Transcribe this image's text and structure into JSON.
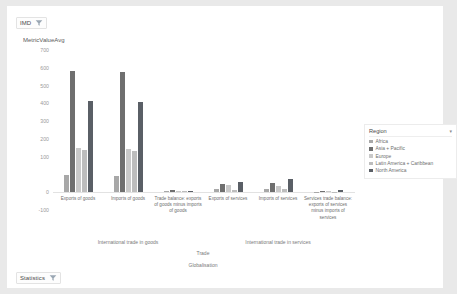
{
  "slicers": {
    "imd": {
      "label": "IMD",
      "icon": "filter-icon"
    },
    "statistics": {
      "label": "Statistics",
      "icon": "filter-icon"
    }
  },
  "legend": {
    "title": "Region",
    "caret": "▾",
    "items": [
      {
        "label": "Africa",
        "color": "#a8a8a8"
      },
      {
        "label": "Asia + Pacific",
        "color": "#6f6f6f"
      },
      {
        "label": "Europe",
        "color": "#c9c9c9"
      },
      {
        "label": "Latin America + Caribbean",
        "color": "#bdbdbd"
      },
      {
        "label": "North America",
        "color": "#5a5f66"
      }
    ]
  },
  "axis_titles": {
    "level1_goods": "International trade in goods",
    "level1_services": "International trade in services",
    "level2": "Trade",
    "level3": "Globalisation"
  },
  "chart_data": {
    "type": "bar",
    "title": "",
    "xlabel": "Trade",
    "ylabel": "MetricValueAvg",
    "ylim": [
      -100,
      700
    ],
    "yticks": [
      700,
      600,
      500,
      400,
      300,
      200,
      100,
      0,
      -100
    ],
    "grid": false,
    "legend_position": "right",
    "categories": [
      "Exports of goods",
      "Imports of goods",
      "Trade balance: exports of goods minus imports of goods",
      "Exports of services",
      "Imports of services",
      "Services trade balance: exports of services minus imports of services"
    ],
    "series": [
      {
        "name": "Africa",
        "color": "#a8a8a8",
        "values": [
          85,
          80,
          5,
          14,
          17,
          -3
        ]
      },
      {
        "name": "Asia + Pacific",
        "color": "#6f6f6f",
        "values": [
          595,
          590,
          8,
          40,
          42,
          2
        ]
      },
      {
        "name": "Europe",
        "color": "#c9c9c9",
        "values": [
          215,
          210,
          6,
          33,
          30,
          4
        ]
      },
      {
        "name": "Latin America + Caribbean",
        "color": "#bdbdbd",
        "values": [
          205,
          200,
          4,
          12,
          16,
          -5
        ]
      },
      {
        "name": "North America",
        "color": "#5a5f66",
        "values": [
          450,
          445,
          6,
          48,
          62,
          10
        ]
      }
    ]
  }
}
